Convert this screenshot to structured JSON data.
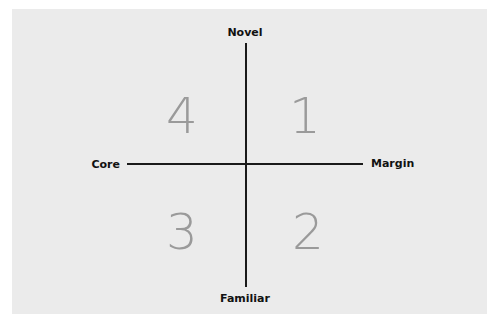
{
  "diagram": {
    "type": "quadrant",
    "axes": {
      "vertical": {
        "top_label": "Novel",
        "bottom_label": "Familiar"
      },
      "horizontal": {
        "left_label": "Core",
        "right_label": "Margin"
      }
    },
    "quadrants": [
      {
        "position": "top-right",
        "number": "1"
      },
      {
        "position": "bottom-right",
        "number": "2"
      },
      {
        "position": "bottom-left",
        "number": "3"
      },
      {
        "position": "top-left",
        "number": "4"
      }
    ],
    "colors": {
      "background": "#ebebeb",
      "axis": "#1a1a1a",
      "label": "#111111",
      "quadrant_number": "#9a9a9a"
    }
  }
}
